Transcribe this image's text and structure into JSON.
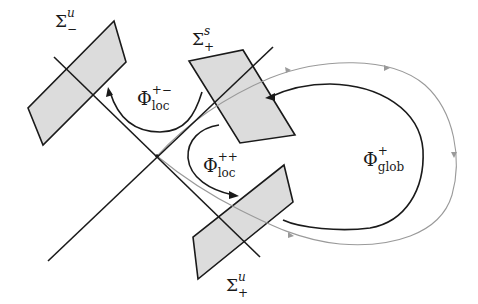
{
  "diagram": {
    "type": "dynamical-systems-section-diagram",
    "colors": {
      "line": "#1a1a1a",
      "section_fill": "#dcdcdc",
      "gray_orbit": "#9a9a9a"
    },
    "sections": [
      {
        "id": "sigma-u-minus",
        "label_base": "Σ",
        "label_sup": "u",
        "label_sub": "−"
      },
      {
        "id": "sigma-s-plus",
        "label_base": "Σ",
        "label_sup": "s",
        "label_sub": "+"
      },
      {
        "id": "sigma-u-plus",
        "label_base": "Σ",
        "label_sup": "u",
        "label_sub": "+"
      }
    ],
    "maps": [
      {
        "id": "phi-loc-plus-minus",
        "label_base": "Φ",
        "label_sup": "+−",
        "label_sub": "loc"
      },
      {
        "id": "phi-loc-plus-plus",
        "label_base": "Φ",
        "label_sup": "++",
        "label_sub": "loc"
      },
      {
        "id": "phi-glob-plus",
        "label_base": "Φ",
        "label_sup": "+",
        "label_sub": "glob"
      }
    ]
  }
}
